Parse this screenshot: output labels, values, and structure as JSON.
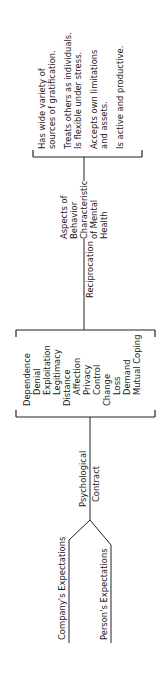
{
  "diagram": {
    "inputs": {
      "company": "Company's Expectations",
      "person": "Person's Expectations"
    },
    "contract_label": [
      "Psychological",
      "Contract"
    ],
    "contract_items": [
      "Dependence",
      "Denial",
      "Exploitation",
      "Legitimacy",
      "Distance",
      "Affection",
      "Privacy",
      "Control",
      "Change",
      "Loss",
      "Demand",
      "Mutual Coping"
    ],
    "reciprocation_label": "Reciprocation",
    "aspects_label": [
      "Aspects of",
      "Behavior",
      "Characteristic",
      "of Mental",
      "Health"
    ],
    "mental_health_items": [
      [
        "Has wide variety of",
        "sources of gratification."
      ],
      [
        "Treats others as individuals.",
        "Is flexible under stress."
      ],
      [
        "Accepts own limitations",
        "and assets."
      ],
      [
        "Is active and productive."
      ]
    ]
  }
}
